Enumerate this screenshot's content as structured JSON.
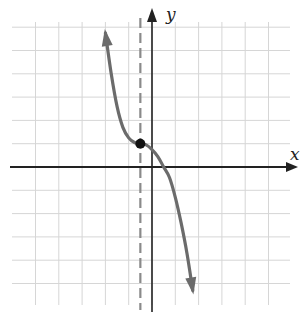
{
  "chart_data": {
    "type": "line",
    "title": "",
    "xlabel": "x",
    "ylabel": "y",
    "xlim": [
      -5,
      5
    ],
    "ylim": [
      -5,
      6
    ],
    "grid": true,
    "grid_step": 1,
    "legend": null,
    "series": [
      {
        "name": "f(x)",
        "description": "decreasing cubic with horizontal inflection point at (-0.5, 1); arrows at both ends",
        "points": [
          [
            -2.0,
            5.75
          ],
          [
            -1.75,
            4.0
          ],
          [
            -1.5,
            2.6
          ],
          [
            -1.25,
            1.7
          ],
          [
            -1.0,
            1.25
          ],
          [
            -0.75,
            1.05
          ],
          [
            -0.5,
            1.0
          ],
          [
            -0.25,
            0.95
          ],
          [
            0.0,
            0.75
          ],
          [
            0.25,
            0.45
          ],
          [
            0.5,
            0.0
          ],
          [
            0.75,
            -0.45
          ],
          [
            1.0,
            -1.3
          ],
          [
            1.25,
            -2.4
          ],
          [
            1.5,
            -3.7
          ],
          [
            1.75,
            -5.3
          ]
        ]
      }
    ],
    "annotations": [
      {
        "type": "point",
        "x": -0.5,
        "y": 1,
        "style": "filled-black"
      },
      {
        "type": "dashed-vertical-line",
        "x": -0.5
      }
    ]
  },
  "labels": {
    "x_axis": "x",
    "y_axis": "y"
  },
  "colors": {
    "grid": "#d6d6d6",
    "axes": "#222222",
    "curve": "#6b6b6b",
    "dashed": "#8a8a8a",
    "point": "#111111"
  }
}
